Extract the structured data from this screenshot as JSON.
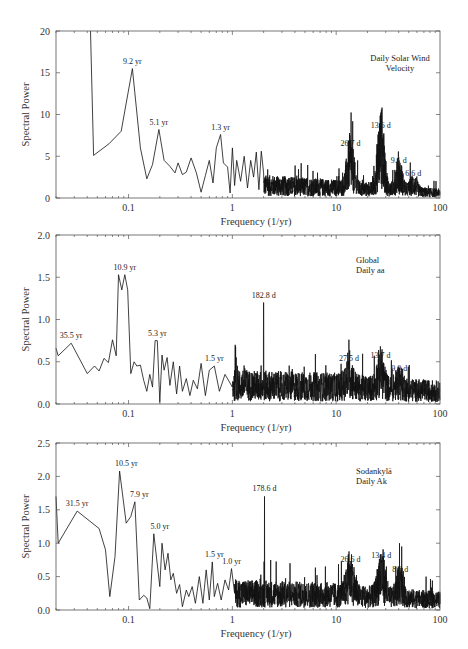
{
  "chart_data": [
    {
      "type": "line",
      "title": "Daily Solar Wind Velocity",
      "title_lines": [
        "Daily Solar Wind",
        "Velocity"
      ],
      "xlabel": "Frequency (1/yr)",
      "ylabel": "Spectral Power",
      "xscale": "log",
      "xlim": [
        0.02,
        100
      ],
      "ylim": [
        0,
        20
      ],
      "yticks": [
        0,
        5,
        10,
        15,
        20
      ],
      "ytick_labels": [
        "0",
        "5",
        "10",
        "15",
        "20"
      ],
      "xticks": [
        0.1,
        1,
        10,
        100
      ],
      "xtick_labels": [
        "0.1",
        "1",
        "10",
        "100"
      ],
      "grid": false,
      "legend": null,
      "annotations": [
        {
          "text": "9.2 yr",
          "freq": 0.109,
          "power": 15.5
        },
        {
          "text": "5.1 yr",
          "freq": 0.196,
          "power": 8.2
        },
        {
          "text": "1.3 yr",
          "freq": 0.77,
          "power": 7.6
        },
        {
          "text": "26.7 d",
          "freq": 13.7,
          "power": 5.6
        },
        {
          "text": "13.6 d",
          "freq": 26.9,
          "power": 7.8
        },
        {
          "text": "9.1 d",
          "freq": 40.1,
          "power": 3.6
        },
        {
          "text": "6.6 d",
          "freq": 55.3,
          "power": 2.0
        }
      ],
      "series": [
        {
          "name": "Solar wind velocity spectrum",
          "x": [
            0.043,
            0.043,
            0.046,
            0.065,
            0.085,
            0.109,
            0.13,
            0.15,
            0.17,
            0.196,
            0.22,
            0.25,
            0.28,
            0.3,
            0.33,
            0.36,
            0.4,
            0.45,
            0.5,
            0.55,
            0.6,
            0.65,
            0.7,
            0.77,
            0.82,
            0.9,
            0.95,
            1.0,
            1.05,
            1.1,
            1.2,
            1.3,
            1.4,
            1.5,
            1.6,
            1.7,
            1.8,
            1.9,
            2.0
          ],
          "y": [
            20,
            20,
            5.1,
            6.5,
            8.0,
            15.5,
            6.0,
            2.3,
            4.0,
            8.2,
            4.5,
            3.8,
            3.0,
            4.2,
            2.8,
            3.1,
            4.8,
            3.0,
            0.7,
            2.7,
            4.5,
            1.8,
            6.0,
            7.6,
            4.2,
            3.7,
            0.6,
            6.0,
            1.5,
            4.5,
            2.0,
            5.0,
            1.2,
            4.5,
            2.5,
            5.5,
            1.0,
            5.6,
            3.0
          ]
        },
        {
          "name": "Noise floor (approx.)",
          "x": [
            2,
            10,
            100
          ],
          "y": [
            1.5,
            1.2,
            0.6
          ]
        }
      ]
    },
    {
      "type": "line",
      "title": "Global Daily aa",
      "title_lines": [
        "Global",
        "Daily aa"
      ],
      "xlabel": "Frequency (1/yr)",
      "ylabel": "Spectral Power",
      "xscale": "log",
      "xlim": [
        0.02,
        100
      ],
      "ylim": [
        0,
        2.0
      ],
      "yticks": [
        0,
        0.5,
        1.0,
        1.5,
        2.0
      ],
      "ytick_labels": [
        "0.0",
        "0.5",
        "1.0",
        "1.5",
        "2.0"
      ],
      "xticks": [
        0.1,
        1,
        10,
        100
      ],
      "xtick_labels": [
        "0.1",
        "1",
        "10",
        "100"
      ],
      "grid": false,
      "legend": null,
      "annotations": [
        {
          "text": "35.5 yr",
          "freq": 0.028,
          "power": 0.72
        },
        {
          "text": "10.9 yr",
          "freq": 0.092,
          "power": 1.53
        },
        {
          "text": "5.3 yr",
          "freq": 0.189,
          "power": 0.75
        },
        {
          "text": "1.5 yr",
          "freq": 0.67,
          "power": 0.45
        },
        {
          "text": "182.8 d",
          "freq": 2.0,
          "power": 1.2
        },
        {
          "text": "27.5 d",
          "freq": 13.3,
          "power": 0.45
        },
        {
          "text": "13.7 d",
          "freq": 26.7,
          "power": 0.48
        },
        {
          "text": "9.0 d",
          "freq": 40.6,
          "power": 0.33
        }
      ],
      "series": [
        {
          "name": "aa index spectrum",
          "x": [
            0.02,
            0.021,
            0.028,
            0.04,
            0.047,
            0.052,
            0.058,
            0.064,
            0.07,
            0.076,
            0.08,
            0.086,
            0.092,
            0.098,
            0.105,
            0.113,
            0.12,
            0.13,
            0.14,
            0.15,
            0.16,
            0.17,
            0.18,
            0.189,
            0.2,
            0.21,
            0.22,
            0.235,
            0.25,
            0.27,
            0.29,
            0.31,
            0.33,
            0.36,
            0.39,
            0.42,
            0.46,
            0.5,
            0.55,
            0.6,
            0.67,
            0.75,
            0.85,
            1.0
          ],
          "y": [
            0.66,
            0.57,
            0.72,
            0.36,
            0.45,
            0.39,
            0.54,
            0.49,
            0.76,
            0.57,
            1.53,
            1.35,
            1.53,
            1.35,
            0.36,
            0.5,
            0.45,
            0.46,
            0.28,
            0.15,
            0.35,
            0.2,
            0.75,
            0.75,
            0.02,
            0.58,
            0.4,
            0.55,
            0.22,
            0.5,
            0.12,
            0.45,
            0.15,
            0.3,
            0.1,
            0.28,
            0.18,
            0.48,
            0.1,
            0.4,
            0.45,
            0.15,
            0.35,
            0.2
          ]
        },
        {
          "name": "Noise floor (approx.)",
          "x": [
            1,
            10,
            100
          ],
          "y": [
            0.22,
            0.2,
            0.15
          ]
        }
      ]
    },
    {
      "type": "line",
      "title": "Sodankylä Daily Ak",
      "title_lines": [
        "Sodankylä",
        "Daily Ak"
      ],
      "xlabel": "Frequency (1/yr)",
      "ylabel": "Spectral Power",
      "xscale": "log",
      "xlim": [
        0.02,
        100
      ],
      "ylim": [
        0,
        2.5
      ],
      "yticks": [
        0,
        0.5,
        1.0,
        1.5,
        2.0,
        2.5
      ],
      "ytick_labels": [
        "0.0",
        "0.5",
        "1.0",
        "1.5",
        "2.0",
        "2.5"
      ],
      "xticks": [
        0.1,
        1,
        10,
        100
      ],
      "xtick_labels": [
        "0.1",
        "1",
        "10",
        "100"
      ],
      "grid": false,
      "legend": null,
      "annotations": [
        {
          "text": "31.5 yr",
          "freq": 0.032,
          "power": 1.48
        },
        {
          "text": "10.5 yr",
          "freq": 0.095,
          "power": 2.08
        },
        {
          "text": "7.9 yr",
          "freq": 0.127,
          "power": 1.62
        },
        {
          "text": "5.0 yr",
          "freq": 0.2,
          "power": 1.14
        },
        {
          "text": "1.5 yr",
          "freq": 0.67,
          "power": 0.72
        },
        {
          "text": "1.0 yr",
          "freq": 0.98,
          "power": 0.62
        },
        {
          "text": "178.6 d",
          "freq": 2.04,
          "power": 1.7
        },
        {
          "text": "26.6 d",
          "freq": 13.7,
          "power": 0.65
        },
        {
          "text": "13.4 d",
          "freq": 27.2,
          "power": 0.7
        },
        {
          "text": "8.8 d",
          "freq": 41.5,
          "power": 0.5
        }
      ],
      "series": [
        {
          "name": "Ak index spectrum",
          "x": [
            0.02,
            0.021,
            0.032,
            0.052,
            0.06,
            0.066,
            0.074,
            0.082,
            0.095,
            0.105,
            0.115,
            0.127,
            0.14,
            0.15,
            0.16,
            0.175,
            0.2,
            0.21,
            0.225,
            0.24,
            0.255,
            0.27,
            0.29,
            0.31,
            0.33,
            0.36,
            0.38,
            0.41,
            0.44,
            0.48,
            0.52,
            0.56,
            0.6,
            0.64,
            0.67,
            0.72,
            0.78,
            0.85,
            0.92,
            0.98,
            1.05
          ],
          "y": [
            1.7,
            1.0,
            1.48,
            1.22,
            0.9,
            0.2,
            0.8,
            2.08,
            1.3,
            1.4,
            1.62,
            0.15,
            0.22,
            0.18,
            0.02,
            1.14,
            0.35,
            1.0,
            0.6,
            0.85,
            0.45,
            0.55,
            0.25,
            0.38,
            0.05,
            0.3,
            0.2,
            0.35,
            0.1,
            0.5,
            0.1,
            0.6,
            0.15,
            0.72,
            0.2,
            0.4,
            0.15,
            0.45,
            0.3,
            0.62,
            0.25
          ]
        },
        {
          "name": "Noise floor (approx.)",
          "x": [
            1,
            10,
            100
          ],
          "y": [
            0.25,
            0.22,
            0.15
          ]
        }
      ]
    }
  ],
  "panels": [
    {
      "ylabel": "Spectral Power",
      "xlabel": "Frequency (1/yr)",
      "title_line1": "Daily Solar Wind",
      "title_line2": "Velocity"
    },
    {
      "ylabel": "Spectral Power",
      "xlabel": "Frequency (1/yr)",
      "title_line1": "Global",
      "title_line2": "Daily aa"
    },
    {
      "ylabel": "Spectral Power",
      "xlabel": "Frequency (1/yr)",
      "title_line1": "Sodankylä",
      "title_line2": "Daily Ak"
    }
  ]
}
